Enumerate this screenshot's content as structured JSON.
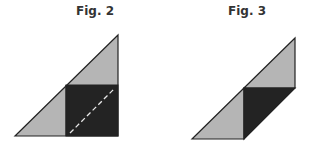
{
  "figures": [
    {
      "title": "Fig. 2",
      "description": "Right triangle with a dark square in the lower-right corner; dashed white diagonal fold line across the square",
      "colors": {
        "light": "#b5b5b5",
        "dark": "#232323",
        "outline": "#222222",
        "dash": "#e8e8e8"
      }
    },
    {
      "title": "Fig. 3",
      "description": "Parallelogram formed by two light triangles and one dark triangle after folding",
      "colors": {
        "light": "#b5b5b5",
        "dark": "#232323",
        "outline": "#222222"
      }
    }
  ]
}
